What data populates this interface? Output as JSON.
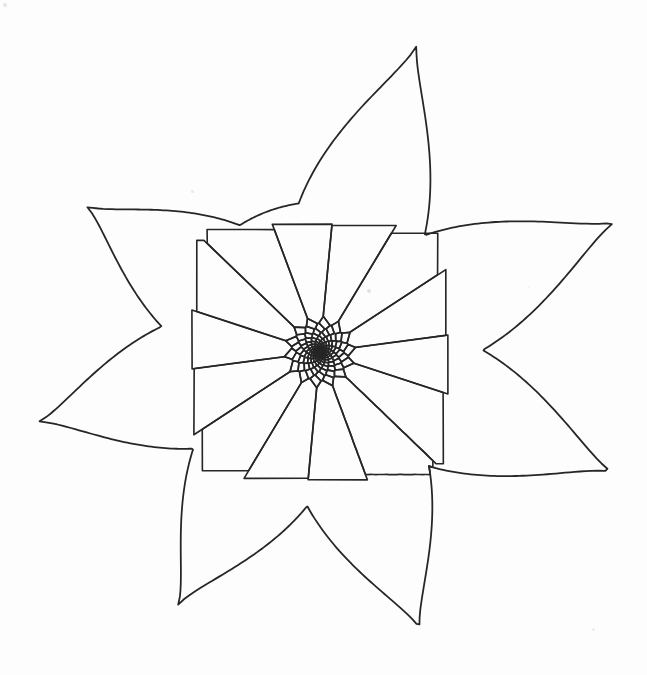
{
  "figure": {
    "background_color": "#fdfdfd",
    "stroke_color": "#262626",
    "stroke_width": 1.7,
    "canvas": {
      "width": 647,
      "height": 675
    }
  },
  "chart_data": {
    "type": "diagram",
    "subtype": "logarithmic-spiral-voronoi-star",
    "center": {
      "x": 320,
      "y": 352
    },
    "point_count": 7,
    "spiral": {
      "divergence_angle_deg": 137.508,
      "growth_ratio_per_ring": 1.205,
      "inner_radius": 3.0,
      "ring_count": 13,
      "cells_per_ring": 14,
      "rotation_offset_deg": -8,
      "chirality": "counterclockwise-outward"
    },
    "tips": [
      {
        "name": "top",
        "x": 417,
        "y": 45,
        "angle_deg": -102.4,
        "radius": 309
      },
      {
        "name": "upper-right",
        "x": 615,
        "y": 222,
        "angle_deg": -23.8,
        "radius": 315
      },
      {
        "name": "right",
        "x": 612,
        "y": 472,
        "angle_deg": 20.2,
        "radius": 311
      },
      {
        "name": "bottom",
        "x": 420,
        "y": 629,
        "angle_deg": 70.2,
        "radius": 294
      },
      {
        "name": "lower-left",
        "x": 178,
        "y": 605,
        "angle_deg": 120.7,
        "radius": 288
      },
      {
        "name": "left",
        "x": 38,
        "y": 422,
        "angle_deg": 167.5,
        "radius": 289
      },
      {
        "name": "upper-left",
        "x": 86,
        "y": 206,
        "angle_deg": -143.1,
        "radius": 283
      }
    ],
    "valley_radius": 150
  },
  "specks": [
    {
      "x": 3,
      "y": 3,
      "size": 4,
      "opacity": 0.35
    },
    {
      "x": 191,
      "y": 190,
      "size": 3,
      "opacity": 0.3
    },
    {
      "x": 367,
      "y": 289,
      "size": 4,
      "opacity": 0.38
    },
    {
      "x": 592,
      "y": 628,
      "size": 3,
      "opacity": 0.22
    },
    {
      "x": 528,
      "y": 286,
      "size": 2,
      "opacity": 0.18
    }
  ]
}
